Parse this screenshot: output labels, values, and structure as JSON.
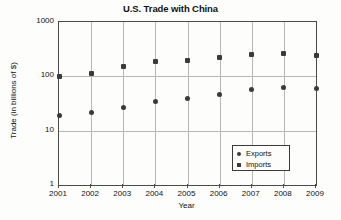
{
  "chart_data": {
    "type": "scatter",
    "title": "U.S. Trade with China",
    "xlabel": "Year",
    "ylabel": "Trade (in billions of $)",
    "yscale": "log",
    "ylim": [
      1,
      1000
    ],
    "yticks": [
      "1",
      "10",
      "100",
      "1000"
    ],
    "categories": [
      "2001",
      "2002",
      "2003",
      "2004",
      "2005",
      "2006",
      "2007",
      "2008",
      "2009"
    ],
    "grid": true,
    "legend_position": "bottom-right",
    "series": [
      {
        "name": "Exports",
        "marker": "circle",
        "color": "#3a3a3a",
        "values": [
          19,
          22,
          27,
          34,
          39,
          46,
          57,
          62,
          60
        ]
      },
      {
        "name": "Imports",
        "marker": "square",
        "color": "#3a3a3a",
        "values": [
          100,
          113,
          152,
          184,
          196,
          222,
          249,
          268,
          240
        ]
      }
    ]
  },
  "legend": {
    "items": [
      {
        "label": "Exports",
        "marker": "circle"
      },
      {
        "label": "Imports",
        "marker": "square"
      }
    ]
  }
}
